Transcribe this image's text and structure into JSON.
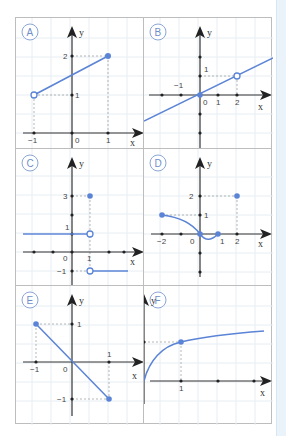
{
  "colors": {
    "curve": "#5b84d6",
    "axis": "#222222",
    "grid": "#e6eef3",
    "guide": "#999999",
    "badge": "#8aa6d8"
  },
  "panels": [
    {
      "label": "A",
      "x_axis": "x",
      "y_axis": "y",
      "ticks_x": [
        "−1",
        "0",
        "1"
      ],
      "ticks_y": [
        "1",
        "2"
      ],
      "description": "Line segment from open point (-1,1) to closed point (1,2)"
    },
    {
      "label": "B",
      "x_axis": "x",
      "y_axis": "y",
      "ticks_x": [
        "−1",
        "0",
        "1",
        "2"
      ],
      "ticks_y": [
        "1"
      ],
      "description": "Line y = x/2 through closed point (0,0) with open point at (2,1)"
    },
    {
      "label": "C",
      "x_axis": "x",
      "y_axis": "y",
      "ticks_x": [
        "0",
        "1"
      ],
      "ticks_y": [
        "3",
        "1",
        "−1"
      ],
      "description": "Step function: y=1 for x<1 (open at 1), closed point (1,3), y=-1 for x>1 (open at 1)"
    },
    {
      "label": "D",
      "x_axis": "x",
      "y_axis": "y",
      "ticks_x": [
        "−2",
        "0",
        "1",
        "2"
      ],
      "ticks_y": [
        "2",
        "1"
      ],
      "description": "Curve from (-2,1) to (0,0) dipping to (1,0), isolated point (2,2)"
    },
    {
      "label": "E",
      "x_axis": "x",
      "y_axis": "y",
      "ticks_x": [
        "−1",
        "0",
        "1"
      ],
      "ticks_y": [
        "1",
        "−1"
      ],
      "description": "Line segment from (-1,1) to (1,-1), closed endpoints"
    },
    {
      "label": "F",
      "x_axis": "x",
      "y_axis": "y",
      "ticks_x": [
        "0",
        "1"
      ],
      "ticks_y": [
        "1"
      ],
      "description": "Square-root-like curve from (0,0) through (1,1)"
    }
  ]
}
